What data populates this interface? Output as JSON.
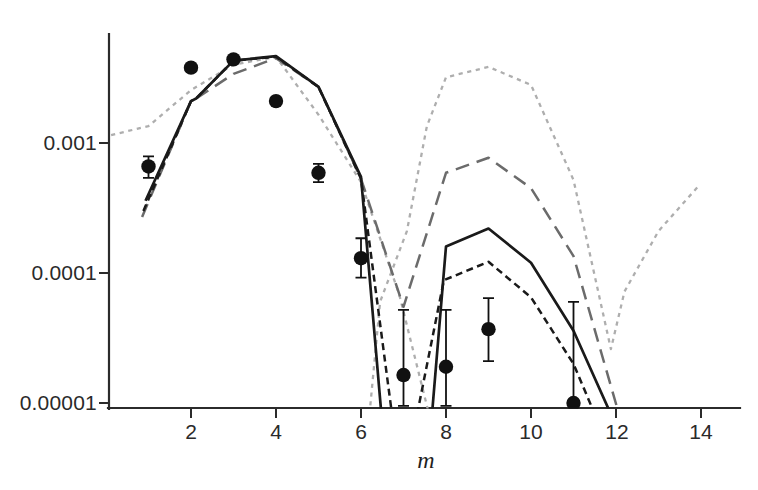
{
  "figure": {
    "background": "#ffffff",
    "axis_color": "#2b2b2b"
  },
  "chart_data": {
    "type": "line",
    "title": "",
    "xlabel": "m",
    "ylabel": "",
    "y_scale": "log",
    "grid": false,
    "legend": "none",
    "xlim": [
      0.07,
      14.9
    ],
    "ylim": [
      9.2e-06,
      0.0068
    ],
    "x_ticks": [
      2,
      4,
      6,
      8,
      10,
      12,
      14
    ],
    "x_tick_labels": [
      "2",
      "4",
      "6",
      "8",
      "10",
      "12",
      "14"
    ],
    "y_ticks": [
      0.001,
      0.0001,
      1e-05
    ],
    "y_tick_labels": [
      "0.001",
      "0.0001",
      "0.00001"
    ],
    "colors": {
      "black_line": "#1a1a1a",
      "gray_dashed": "#6b6b6b",
      "light_dotted": "#aeaeae",
      "axis": "#2b2b2b",
      "point": "#111111"
    },
    "series": [
      {
        "name": "light-gray-dotted-fit",
        "label": "light gray dotted fit curve",
        "dash": "dotted",
        "color_key": "light_dotted",
        "width": 2.3,
        "segments": [
          [
            [
              0.12,
              0.00115
            ],
            [
              1,
              0.00135
            ],
            [
              2,
              0.00255
            ],
            [
              3,
              0.004
            ],
            [
              4,
              0.0046
            ],
            [
              5,
              0.00165
            ],
            [
              6,
              0.0005
            ],
            [
              6.9,
              6.8e-05
            ],
            [
              7.6,
              8.2e-06
            ]
          ],
          [
            [
              6.2,
              8.2e-06
            ],
            [
              6.45,
              6e-05
            ],
            [
              7.08,
              0.00021
            ],
            [
              7.55,
              0.00135
            ],
            [
              8,
              0.0032
            ],
            [
              9,
              0.00385
            ],
            [
              10,
              0.0028
            ],
            [
              11,
              0.00052
            ],
            [
              11.88,
              2.6e-05
            ],
            [
              12.2,
              7.2e-05
            ],
            [
              13,
              0.00021
            ],
            [
              13.95,
              0.00047
            ]
          ]
        ]
      },
      {
        "name": "gray-long-dashed-fit",
        "label": "gray long-dashed fit curve",
        "dash": "long",
        "color_key": "gray_dashed",
        "width": 2.5,
        "segments": [
          [
            [
              0.85,
              0.00027
            ],
            [
              2,
              0.0021
            ],
            [
              2.12,
              0.0022
            ],
            [
              3,
              0.0034
            ],
            [
              4,
              0.0045
            ],
            [
              5,
              0.0027
            ],
            [
              6,
              0.00053
            ],
            [
              7,
              5.5e-05
            ],
            [
              8,
              0.00059
            ],
            [
              9,
              0.00077
            ],
            [
              10,
              0.00045
            ],
            [
              11,
              0.000135
            ],
            [
              12.07,
              8.2e-06
            ]
          ]
        ]
      },
      {
        "name": "solid-black-fit",
        "label": "solid black fit curve",
        "dash": "solid",
        "color_key": "black_line",
        "width": 2.7,
        "segments": [
          [
            [
              0.93,
              0.00036
            ],
            [
              2,
              0.0021
            ],
            [
              2.12,
              0.0022
            ],
            [
              3,
              0.0043
            ],
            [
              4,
              0.00465
            ],
            [
              5,
              0.0027
            ],
            [
              6,
              0.00055
            ],
            [
              6.48,
              8.2e-06
            ]
          ],
          [
            [
              7.67,
              8.2e-06
            ],
            [
              8,
              0.00016
            ],
            [
              9,
              0.00022
            ],
            [
              10,
              0.00012
            ],
            [
              11,
              3.6e-05
            ],
            [
              11.88,
              8.2e-06
            ]
          ]
        ]
      },
      {
        "name": "black-short-dashed-fit",
        "label": "black short-dashed fit curve",
        "dash": "short",
        "color_key": "black_line",
        "width": 2.5,
        "segments": [
          [
            [
              0.88,
              0.0003
            ],
            [
              2,
              0.0021
            ],
            [
              2.12,
              0.0022
            ],
            [
              3,
              0.0043
            ],
            [
              4,
              0.0046
            ],
            [
              5,
              0.0027
            ],
            [
              6,
              0.00053
            ],
            [
              6.73,
              8.2e-06
            ]
          ],
          [
            [
              7.32,
              8.2e-06
            ],
            [
              7.95,
              8.8e-05
            ],
            [
              9,
              0.000122
            ],
            [
              10,
              6.5e-05
            ],
            [
              11,
              2e-05
            ],
            [
              11.5,
              8.2e-06
            ]
          ]
        ]
      }
    ],
    "points": [
      {
        "m": 1,
        "value": 0.00066,
        "err_lo": 0.00054,
        "err_hi": 0.00079
      },
      {
        "m": 2,
        "value": 0.0038,
        "err_lo": null,
        "err_hi": null
      },
      {
        "m": 3,
        "value": 0.0044,
        "err_lo": null,
        "err_hi": null
      },
      {
        "m": 4,
        "value": 0.0021,
        "err_lo": null,
        "err_hi": null
      },
      {
        "m": 5,
        "value": 0.00059,
        "err_lo": 0.0005,
        "err_hi": 0.00069
      },
      {
        "m": 6,
        "value": 0.00013,
        "err_lo": 9.2e-05,
        "err_hi": 0.000185
      },
      {
        "m": 7,
        "value": 1.64e-05,
        "err_lo": 9.5e-06,
        "err_hi": 5.2e-05
      },
      {
        "m": 8,
        "value": 1.9e-05,
        "err_lo": 9.5e-06,
        "err_hi": 5.2e-05
      },
      {
        "m": 9,
        "value": 3.7e-05,
        "err_lo": 2.1e-05,
        "err_hi": 6.4e-05
      },
      {
        "m": 11,
        "value": 1e-05,
        "err_lo": 9.2e-06,
        "err_hi": 6e-05
      }
    ]
  }
}
